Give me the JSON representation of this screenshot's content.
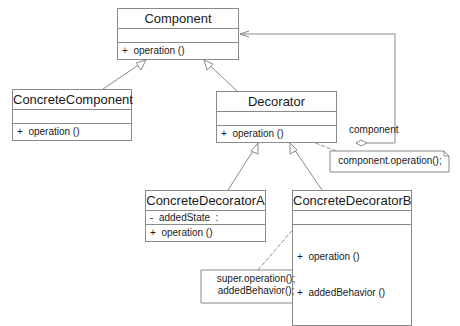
{
  "classes": {
    "component": {
      "name": "Component",
      "attributes": "",
      "operations": [
        "+  operation ()"
      ]
    },
    "concrete_component": {
      "name": "ConcreteComponent",
      "attributes": "",
      "operations": [
        "+  operation ()"
      ]
    },
    "decorator": {
      "name": "Decorator",
      "attributes": "",
      "operations": [
        "+  operation ()"
      ]
    },
    "concrete_decorator_a": {
      "name": "ConcreteDecoratorA",
      "attributes": "-  addedState  :",
      "operations": [
        "+  operation ()"
      ]
    },
    "concrete_decorator_b": {
      "name": "ConcreteDecoratorB",
      "attributes": "",
      "operations": [
        "+  operation ()",
        "+  addedBehavior ()"
      ]
    }
  },
  "association": {
    "role_label": "component"
  },
  "notes": {
    "decorator_note": "component.operation();",
    "decorator_b_note_line1": "super.operation();",
    "decorator_b_note_line2": "addedBehavior();"
  },
  "colors": {
    "line": "#8a8a8a",
    "text": "#1a1a1a"
  }
}
